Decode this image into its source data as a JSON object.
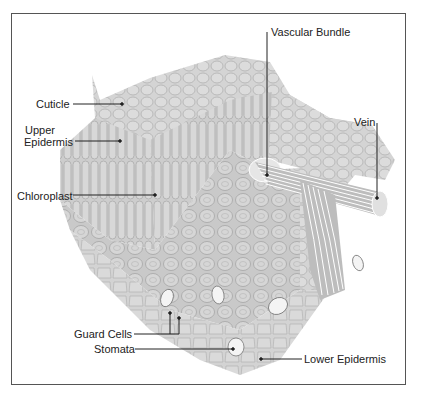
{
  "diagram": {
    "type": "leaf cross-section illustration",
    "labels": {
      "cuticle": "Cuticle",
      "upper_epidermis_1": "Upper",
      "upper_epidermis_2": "Epidermis",
      "chloroplast": "Chloroplast",
      "vascular_bundle": "Vascular Bundle",
      "vein": "Vein",
      "guard_cells": "Guard Cells",
      "stomata": "Stomata",
      "lower_epidermis": "Lower Epidermis"
    },
    "colors": {
      "tissue": "#d2d2d2",
      "tissue_dark": "#b9b9b9",
      "cell_outline": "#a8a8a8",
      "leader_line": "#222222",
      "frame": "#555555"
    }
  }
}
